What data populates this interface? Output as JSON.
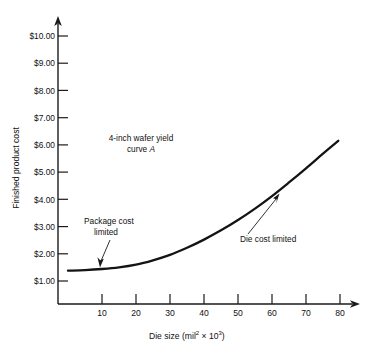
{
  "chart_data": {
    "type": "line",
    "title": "",
    "xlabel": "Die size (mil2 × 103)",
    "xlabel_parts": {
      "lead": "Die size (mil",
      "sup1": "2",
      "mid": " × 10",
      "sup2": "3",
      "tail": ")"
    },
    "ylabel": "Finished product cost",
    "xlim": [
      0,
      85
    ],
    "ylim": [
      0,
      10.6
    ],
    "grid": false,
    "legend": "none",
    "xticks": [
      10,
      20,
      30,
      40,
      50,
      60,
      70,
      80
    ],
    "xtick_labels": [
      "10",
      "20",
      "30",
      "40",
      "50",
      "60",
      "70",
      "80"
    ],
    "yticks": [
      1,
      2,
      3,
      4,
      5,
      6,
      7,
      8,
      9,
      10
    ],
    "ytick_labels": [
      "$1.00",
      "$2.00",
      "$3.00",
      "$4.00",
      "$5.00",
      "$6.00",
      "$7.00",
      "$8.00",
      "$9.00",
      "$10.00"
    ],
    "series": [
      {
        "name": "4-inch wafer yield curve A",
        "x": [
          0,
          5,
          10,
          15,
          20,
          25,
          30,
          35,
          40,
          45,
          50,
          55,
          60,
          65,
          70,
          75,
          79.5
        ],
        "y": [
          1.38,
          1.4,
          1.44,
          1.5,
          1.6,
          1.76,
          1.96,
          2.22,
          2.52,
          2.86,
          3.24,
          3.66,
          4.12,
          4.62,
          5.14,
          5.68,
          6.15
        ]
      }
    ],
    "annotations": [
      {
        "id": "curve-label",
        "line1": "4-inch wafer yield",
        "line2_lead": "curve ",
        "line2_italic": "A",
        "x": 26,
        "y": 6.4
      },
      {
        "id": "package-cost-limited",
        "line1": "Package cost",
        "line2": "limited",
        "points_to_x": 10,
        "points_to_y": 1.44
      },
      {
        "id": "die-cost-limited",
        "line1": "Die cost limited",
        "points_to_x": 62,
        "points_to_y": 4.3
      }
    ]
  },
  "axes": {
    "y_axis_name": "Finished product cost",
    "x_axis_name": "Die size"
  }
}
